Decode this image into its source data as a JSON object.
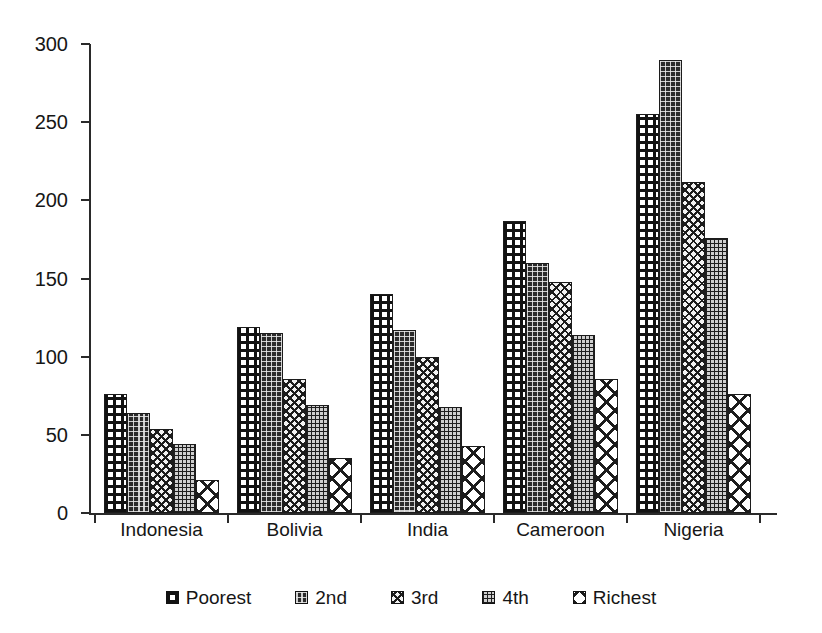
{
  "chart_data": {
    "type": "bar",
    "title": "",
    "subtitle": "",
    "xlabel": "",
    "ylabel": "",
    "categories": [
      "Indonesia",
      "Bolivia",
      "India",
      "Cameroon",
      "Nigeria"
    ],
    "series": [
      {
        "name": "Poorest",
        "pattern": "square-lattice-black-on-white",
        "values": [
          76,
          119,
          140,
          187,
          255
        ]
      },
      {
        "name": "2nd",
        "pattern": "dark-fill-light-dot-lattice",
        "values": [
          64,
          115,
          117,
          160,
          290
        ]
      },
      {
        "name": "3rd",
        "pattern": "small-diagonal-crosshatch",
        "values": [
          54,
          86,
          100,
          148,
          212
        ]
      },
      {
        "name": "4th",
        "pattern": "fine-dark-grid",
        "values": [
          44,
          69,
          68,
          114,
          176
        ]
      },
      {
        "name": "Richest",
        "pattern": "large-diagonal-crosshatch",
        "values": [
          21,
          35,
          43,
          86,
          76
        ]
      }
    ],
    "ylim": [
      0,
      300
    ],
    "yticks": [
      0,
      50,
      100,
      150,
      200,
      250,
      300
    ],
    "ytick_labels": [
      "0",
      "50",
      "100",
      "150",
      "200",
      "250",
      "300"
    ],
    "grid": false,
    "legend_position": "bottom",
    "legend_entries": [
      "Poorest",
      "2nd",
      "3rd",
      "4th",
      "Richest"
    ],
    "axis_color": "#2a2a2a",
    "text_color": "#161616",
    "background": "#ffffff"
  }
}
